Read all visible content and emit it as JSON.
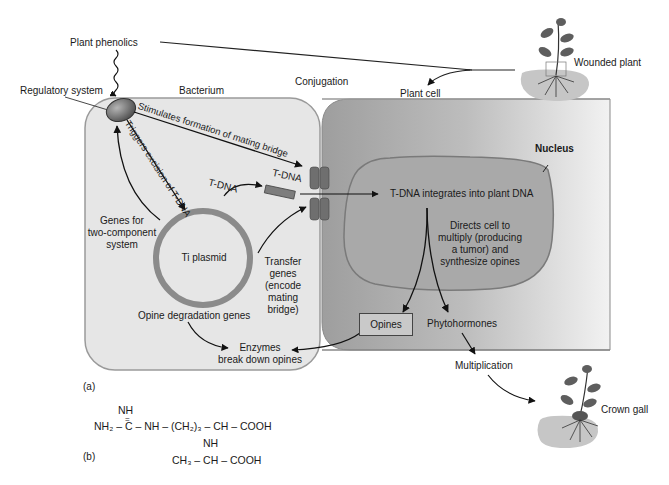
{
  "figure": {
    "panel_a_label": "(a)",
    "panel_b_label": "(b)",
    "colors": {
      "bacterium_fill": "#e3e3e3",
      "plant_cell_fill": "#b5b5b5",
      "nucleus_fill": "#a8a8a8",
      "plasmid_ring": "#8a8a8a",
      "regulatory_system": "#6f6f6f",
      "soil": "#c8c8c8"
    }
  },
  "labels": {
    "plant_phenolics": "Plant phenolics",
    "regulatory_system": "Regulatory system",
    "bacterium": "Bacterium",
    "conjugation": "Conjugation",
    "plant_cell": "Plant cell",
    "wounded_plant": "Wounded plant",
    "nucleus": "Nucleus",
    "stimulates": "Stimulates formation of mating bridge",
    "triggers": "Triggers excision of T-DNA",
    "tdna_plasmid": "T-DNA",
    "tdna_transfer": "T-DNA",
    "genes_two_component": [
      "Genes for",
      "two-component",
      "system"
    ],
    "ti_plasmid": "Ti plasmid",
    "transfer_genes": [
      "Transfer",
      "genes",
      "(encode",
      "mating",
      "bridge)"
    ],
    "opine_degradation": "Opine degradation genes",
    "enzymes": [
      "Enzymes",
      "break down opines"
    ],
    "tdna_integrates": "T-DNA integrates into plant DNA",
    "directs_cell": [
      "Directs cell to",
      "multiply (producing",
      "a tumor) and",
      "synthesize opines"
    ],
    "opines": "Opines",
    "phytohormones": "Phytohormones",
    "multiplication": "Multiplication",
    "crown_gall": "Crown gall"
  },
  "chemical_structure": {
    "line1": "NH",
    "line2": "=",
    "line3": "NH₂ – C – NH – (CH₂)₃ – CH – COOH",
    "line4": "NH",
    "line5": "CH₃ – CH – COOH"
  }
}
